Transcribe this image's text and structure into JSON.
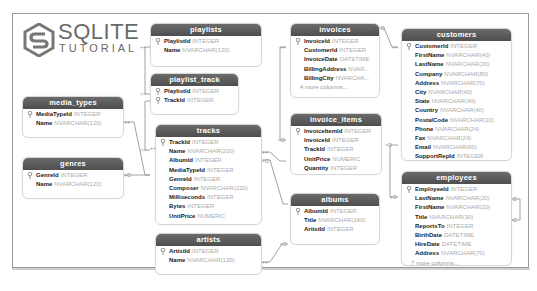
{
  "logo": {
    "line1": "SQLITE",
    "line2": "TUTORIAL"
  },
  "colors": {
    "header_bg": "#5a5a5a",
    "header_text": "#ffffff",
    "column_name": "#222222",
    "column_type": "#aaaaaa",
    "line": "#8a8a8a"
  },
  "tables": {
    "playlists": {
      "title": "playlists",
      "columns": [
        {
          "name": "PlaylistId",
          "type": "INTEGER",
          "key": true
        },
        {
          "name": "Name",
          "type": "NVARCHAR(120)"
        }
      ]
    },
    "playlist_track": {
      "title": "playlist_track",
      "columns": [
        {
          "name": "PlaylistId",
          "type": "INTEGER",
          "key": true
        },
        {
          "name": "TrackId",
          "type": "INTEGER",
          "key": true
        }
      ]
    },
    "media_types": {
      "title": "media_types",
      "columns": [
        {
          "name": "MediaTypeId",
          "type": "INTEGER",
          "key": true
        },
        {
          "name": "Name",
          "type": "NVARCHAR(120)"
        }
      ]
    },
    "genres": {
      "title": "genres",
      "columns": [
        {
          "name": "GenreId",
          "type": "INTEGER",
          "key": true
        },
        {
          "name": "Name",
          "type": "NVARCHAR(120)"
        }
      ]
    },
    "tracks": {
      "title": "tracks",
      "columns": [
        {
          "name": "TrackId",
          "type": "INTEGER",
          "key": true
        },
        {
          "name": "Name",
          "type": "NVARCHAR(200)"
        },
        {
          "name": "AlbumId",
          "type": "INTEGER"
        },
        {
          "name": "MediaTypeId",
          "type": "INTEGER"
        },
        {
          "name": "GenreId",
          "type": "INTEGER"
        },
        {
          "name": "Composer",
          "type": "NVARCHAR(220)"
        },
        {
          "name": "Milliseconds",
          "type": "INTEGER"
        },
        {
          "name": "Bytes",
          "type": "INTEGER"
        },
        {
          "name": "UnitPrice",
          "type": "NUMERIC"
        }
      ]
    },
    "artists": {
      "title": "artists",
      "columns": [
        {
          "name": "ArtistId",
          "type": "INTEGER",
          "key": true
        },
        {
          "name": "Name",
          "type": "NVARCHAR(120)"
        }
      ]
    },
    "invoices": {
      "title": "invoices",
      "columns": [
        {
          "name": "InvoiceId",
          "type": "INTEGER",
          "key": true
        },
        {
          "name": "CustomerId",
          "type": "INTEGER"
        },
        {
          "name": "InvoiceDate",
          "type": "DATETIME"
        },
        {
          "name": "BillingAddress",
          "type": "NVAR..."
        },
        {
          "name": "BillingCity",
          "type": "NVARCHA..."
        }
      ],
      "more": "4 more columns..."
    },
    "invoice_items": {
      "title": "invoice_items",
      "columns": [
        {
          "name": "InvoiceItemId",
          "type": "INTEGER",
          "key": true
        },
        {
          "name": "InvoiceId",
          "type": "INTEGER"
        },
        {
          "name": "TrackId",
          "type": "INTEGER"
        },
        {
          "name": "UnitPrice",
          "type": "NUMERIC"
        },
        {
          "name": "Quantity",
          "type": "INTEGER"
        }
      ]
    },
    "albums": {
      "title": "albums",
      "columns": [
        {
          "name": "AlbumId",
          "type": "INTEGER",
          "key": true
        },
        {
          "name": "Title",
          "type": "NVARCHAR(160)"
        },
        {
          "name": "ArtistId",
          "type": "INTEGER"
        }
      ]
    },
    "customers": {
      "title": "customers",
      "columns": [
        {
          "name": "CustomerId",
          "type": "INTEGER",
          "key": true
        },
        {
          "name": "FirstName",
          "type": "NVARCHAR(40)"
        },
        {
          "name": "LastName",
          "type": "NVARCHAR(20)"
        },
        {
          "name": "Company",
          "type": "NVARCHAR(80)"
        },
        {
          "name": "Address",
          "type": "NVARCHAR(70)"
        },
        {
          "name": "City",
          "type": "NVARCHAR(40)"
        },
        {
          "name": "State",
          "type": "NVARCHAR(40)"
        },
        {
          "name": "Country",
          "type": "NVARCHAR(40)"
        },
        {
          "name": "PostalCode",
          "type": "NVARCHAR(10)"
        },
        {
          "name": "Phone",
          "type": "NVARCHAR(24)"
        },
        {
          "name": "Fax",
          "type": "NVARCHAR(24)"
        },
        {
          "name": "Email",
          "type": "NVARCHAR(60)"
        },
        {
          "name": "SupportRepId",
          "type": "INTEGER"
        }
      ]
    },
    "employees": {
      "title": "employees",
      "columns": [
        {
          "name": "EmployeeId",
          "type": "INTEGER",
          "key": true
        },
        {
          "name": "LastName",
          "type": "NVARCHAR(20)"
        },
        {
          "name": "FirstName",
          "type": "NVARCHAR(20)"
        },
        {
          "name": "Title",
          "type": "NVARCHAR(30)"
        },
        {
          "name": "ReportsTo",
          "type": "INTEGER"
        },
        {
          "name": "BirthDate",
          "type": "DATETIME"
        },
        {
          "name": "HireDate",
          "type": "DATETIME"
        },
        {
          "name": "Address",
          "type": "NVARCHAR(70)"
        }
      ],
      "more": "7 more columns..."
    }
  }
}
